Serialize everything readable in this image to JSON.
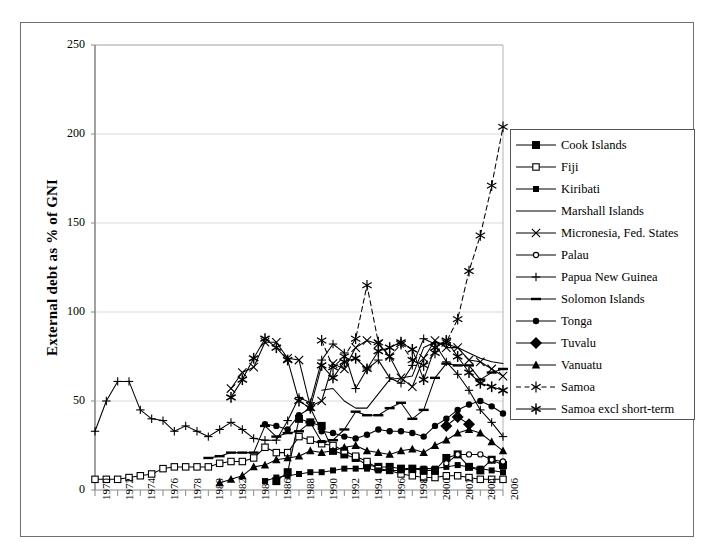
{
  "figure": {
    "y_axis_title": "External debt as % of GNI"
  },
  "chart_data": {
    "type": "line",
    "title": "",
    "xlabel": "",
    "ylabel": "External debt as % of GNI",
    "xlim": [
      1970,
      2006
    ],
    "ylim": [
      0,
      250
    ],
    "grid": "horizontal",
    "legend_position": "right",
    "ytick_labels": [
      "0",
      "50",
      "100",
      "150",
      "200",
      "250"
    ],
    "yticks": [
      0,
      50,
      100,
      150,
      200,
      250
    ],
    "xtick_labels": [
      "1970",
      "1972",
      "1974",
      "1976",
      "1978",
      "1980",
      "1982",
      "1984",
      "1986",
      "1988",
      "1990",
      "1992",
      "1994",
      "1996",
      "1998",
      "2000",
      "2002",
      "2004",
      "2006"
    ],
    "xticks": [
      1970,
      1972,
      1974,
      1976,
      1978,
      1980,
      1982,
      1984,
      1986,
      1988,
      1990,
      1992,
      1994,
      1996,
      1998,
      2000,
      2002,
      2004,
      2006
    ],
    "x": [
      1970,
      1971,
      1972,
      1973,
      1974,
      1975,
      1976,
      1977,
      1978,
      1979,
      1980,
      1981,
      1982,
      1983,
      1984,
      1985,
      1986,
      1987,
      1988,
      1989,
      1990,
      1991,
      1992,
      1993,
      1994,
      1995,
      1996,
      1997,
      1998,
      1999,
      2000,
      2001,
      2002,
      2003,
      2004,
      2005,
      2006
    ],
    "series": [
      {
        "name": "Cook Islands",
        "marker": "filled-square",
        "line": "solid",
        "color": "#000000",
        "x": [
          1986,
          1987,
          1988,
          1989,
          1990,
          1991,
          1992,
          1993,
          1994,
          1995,
          1996,
          1997,
          1998,
          1999,
          2000,
          2001,
          2002,
          2003,
          2004,
          2005,
          2006
        ],
        "values": [
          5,
          10,
          40,
          38,
          36,
          22,
          20,
          18,
          14,
          13,
          13,
          12,
          12,
          11,
          11,
          18,
          20,
          13,
          11,
          17,
          14
        ]
      },
      {
        "name": "Fiji",
        "marker": "open-square",
        "line": "solid",
        "color": "#000000",
        "x": [
          1970,
          1971,
          1972,
          1973,
          1974,
          1975,
          1976,
          1977,
          1978,
          1979,
          1980,
          1981,
          1982,
          1983,
          1984,
          1985,
          1986,
          1987,
          1988,
          1989,
          1990,
          1991,
          1992,
          1993,
          1994,
          1995,
          1996,
          1997,
          1998,
          1999,
          2000,
          2001,
          2002,
          2003,
          2004,
          2005,
          2006
        ],
        "values": [
          6,
          6,
          6,
          7,
          8,
          9,
          12,
          13,
          13,
          13,
          13,
          15,
          16,
          16,
          18,
          24,
          21,
          21,
          30,
          28,
          26,
          25,
          22,
          19,
          16,
          12,
          11,
          9,
          8,
          7,
          7,
          8,
          8,
          7,
          6,
          6,
          6
        ]
      },
      {
        "name": "Kiribati",
        "marker": "filled-square-sm",
        "line": "solid",
        "color": "#000000",
        "x": [
          1985,
          1986,
          1987,
          1988,
          1989,
          1990,
          1991,
          1992,
          1993,
          1994,
          1995,
          1996,
          1997,
          1998,
          1999,
          2000,
          2001,
          2002,
          2003,
          2004,
          2005,
          2006
        ],
        "values": [
          5,
          7,
          8,
          9,
          10,
          10,
          11,
          12,
          12,
          12,
          11,
          11,
          11,
          12,
          12,
          12,
          13,
          14,
          13,
          12,
          11,
          10
        ]
      },
      {
        "name": "Marshall Islands",
        "marker": "none",
        "line": "solid",
        "color": "#000000",
        "x": [
          1990,
          1991,
          1992,
          1993,
          1994,
          1995,
          1996,
          1997,
          1998,
          1999,
          2000,
          2001,
          2002,
          2003,
          2004,
          2005,
          2006
        ],
        "values": [
          56,
          57,
          50,
          46,
          46,
          54,
          62,
          63,
          64,
          80,
          83,
          82,
          80,
          77,
          74,
          72,
          71
        ]
      },
      {
        "name": "Micronesia, Fed. States",
        "marker": "x-cross",
        "line": "solid",
        "color": "#000000",
        "x": [
          1982,
          1983,
          1984,
          1985,
          1986,
          1987,
          1988,
          1989,
          1990,
          1991,
          1992,
          1993,
          1994,
          1995,
          1996,
          1997,
          1998,
          1999,
          2000,
          2001,
          2002,
          2003,
          2004,
          2005,
          2006
        ],
        "values": [
          57,
          66,
          69,
          83,
          83,
          74,
          73,
          47,
          50,
          71,
          68,
          80,
          84,
          82,
          75,
          63,
          58,
          74,
          84,
          80,
          80,
          73,
          72,
          68,
          64
        ]
      },
      {
        "name": "Palau",
        "marker": "open-circle-sm",
        "line": "solid",
        "color": "#000000",
        "x": [
          2001,
          2002,
          2003,
          2004,
          2005,
          2006
        ],
        "values": [
          15,
          20,
          20,
          20,
          17,
          16
        ]
      },
      {
        "name": "Papua New Guinea",
        "marker": "plus",
        "line": "solid",
        "color": "#000000",
        "x": [
          1970,
          1971,
          1972,
          1973,
          1974,
          1975,
          1976,
          1977,
          1978,
          1979,
          1980,
          1981,
          1982,
          1983,
          1984,
          1985,
          1986,
          1987,
          1988,
          1989,
          1990,
          1991,
          1992,
          1993,
          1994,
          1995,
          1996,
          1997,
          1998,
          1999,
          2000,
          2001,
          2002,
          2003,
          2004,
          2005,
          2006
        ],
        "values": [
          33,
          50,
          61,
          61,
          45,
          40,
          39,
          33,
          36,
          33,
          30,
          34,
          38,
          34,
          29,
          28,
          28,
          39,
          52,
          49,
          73,
          82,
          77,
          57,
          68,
          73,
          63,
          60,
          70,
          85,
          82,
          72,
          65,
          56,
          45,
          38,
          30
        ]
      },
      {
        "name": "Solomon Islands",
        "marker": "dash",
        "line": "solid",
        "color": "#000000",
        "x": [
          1980,
          1981,
          1982,
          1983,
          1984,
          1985,
          1986,
          1987,
          1988,
          1989,
          1990,
          1991,
          1992,
          1993,
          1994,
          1995,
          1996,
          1997,
          1998,
          1999,
          2000,
          2001,
          2002,
          2003,
          2004,
          2005,
          2006
        ],
        "values": [
          18,
          19,
          21,
          21,
          21,
          36,
          30,
          32,
          33,
          38,
          27,
          28,
          34,
          44,
          42,
          42,
          46,
          49,
          40,
          45,
          63,
          71,
          70,
          70,
          62,
          66,
          68
        ]
      },
      {
        "name": "Tonga",
        "marker": "filled-circle",
        "line": "solid",
        "color": "#000000",
        "x": [
          1985,
          1986,
          1987,
          1988,
          1989,
          1990,
          1991,
          1992,
          1993,
          1994,
          1995,
          1996,
          1997,
          1998,
          1999,
          2000,
          2001,
          2002,
          2003,
          2004,
          2005,
          2006
        ],
        "values": [
          37,
          36,
          34,
          42,
          46,
          33,
          32,
          30,
          29,
          31,
          34,
          33,
          33,
          32,
          30,
          36,
          40,
          45,
          48,
          50,
          47,
          43
        ]
      },
      {
        "name": "Tuvalu",
        "marker": "filled-diamond",
        "line": "solid",
        "color": "#000000",
        "x": [
          2001,
          2002,
          2003
        ],
        "values": [
          36,
          41,
          37
        ]
      },
      {
        "name": "Vanuatu",
        "marker": "filled-triangle",
        "line": "solid",
        "color": "#000000",
        "x": [
          1981,
          1982,
          1983,
          1984,
          1985,
          1986,
          1987,
          1988,
          1989,
          1990,
          1991,
          1992,
          1993,
          1994,
          1995,
          1996,
          1997,
          1998,
          1999,
          2000,
          2001,
          2002,
          2003,
          2004,
          2005,
          2006
        ],
        "values": [
          4,
          6,
          8,
          13,
          14,
          17,
          18,
          19,
          22,
          21,
          22,
          24,
          25,
          22,
          21,
          20,
          22,
          23,
          21,
          25,
          28,
          32,
          34,
          32,
          27,
          22
        ]
      },
      {
        "name": "Samoa",
        "marker": "star6-open",
        "line": "dashed",
        "color": "#000000",
        "x": [
          1990,
          1991,
          1992,
          1993,
          1994,
          1995,
          1996,
          1997,
          1998,
          1999,
          2000,
          2001,
          2002,
          2003,
          2004,
          2005,
          2006
        ],
        "values": [
          84,
          69,
          75,
          85,
          115,
          83,
          75,
          82,
          73,
          70,
          77,
          83,
          96,
          123,
          143,
          171,
          204
        ]
      },
      {
        "name": "Samoa excl short-term",
        "marker": "star6-bold",
        "line": "solid",
        "color": "#000000",
        "x": [
          1982,
          1983,
          1984,
          1985,
          1986,
          1987,
          1988,
          1989,
          1990,
          1991,
          1992,
          1993,
          1994,
          1995,
          1996,
          1997,
          1998,
          1999,
          2000,
          2001,
          2002,
          2003,
          2004,
          2005,
          2006
        ],
        "values": [
          52,
          62,
          74,
          85,
          80,
          73,
          50,
          46,
          70,
          63,
          72,
          74,
          68,
          78,
          80,
          83,
          79,
          62,
          80,
          84,
          75,
          66,
          60,
          58,
          56
        ]
      }
    ]
  }
}
